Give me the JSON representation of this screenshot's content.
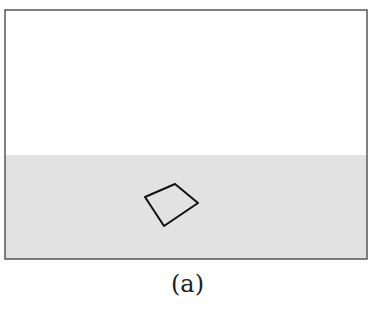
{
  "figure": {
    "caption": "(a)",
    "frame": {
      "x": 5,
      "y": 10,
      "width": 362,
      "height": 249,
      "stroke": "#555555"
    },
    "ground": {
      "y": 155,
      "color": "#e2e2e2"
    },
    "sky_color": "#ffffff",
    "quadrilateral": {
      "points": "145,197 175,184 198,203 164,226",
      "stroke": "#111111"
    }
  }
}
